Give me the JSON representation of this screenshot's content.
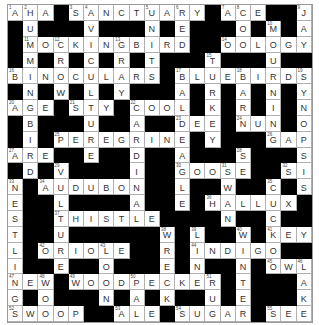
{
  "puzzle": {
    "rows": 20,
    "cols": 20,
    "grid": [
      "AHA#SANCTUARY#ACE##J",
      "#U###V###N#E###O#M#A",
      "#MOCKINGBIRD##OOLOGY",
      "#M#R#C#R#T###T###U##",
      "BINOCULARS#BLUEBIRDS",
      "#N#W#L#Y###A#R#A#N#Y",
      "AGE#STY#COOL#K#R#I#N",
      "#B###U##A##DEE#NUN#O",
      "#I#PEREGRINE#Y###GAP",
      "ARE##E##D##A###S###S",
      "#D#V####I##GOOSE##SI",
      "N#AUDUBON##L##W##C#S",
      "E##L####A##E#HALLUX#",
      "S##THISTLE####N##C##",
      "T##U######W#L##W#KEY",
      "L#ORIOLE##R#INDIGO##",
      "I##E##O###E#N##N#OWL",
      "NEW#WOODPECKER#T###A",
      "G#O###N#A#K##U#E###K",
      "SWOOP##ALE#SUGAR#SEE"
    ],
    "numbers": [
      [
        1,
        1,
        1
      ],
      [
        1,
        2,
        2
      ],
      [
        1,
        5,
        3
      ],
      [
        1,
        6,
        4
      ],
      [
        1,
        10,
        5
      ],
      [
        1,
        12,
        6
      ],
      [
        1,
        15,
        7
      ],
      [
        1,
        16,
        8
      ],
      [
        1,
        20,
        9
      ],
      [
        2,
        18,
        10
      ],
      [
        3,
        2,
        11
      ],
      [
        3,
        4,
        12
      ],
      [
        3,
        8,
        13
      ],
      [
        3,
        15,
        14
      ],
      [
        4,
        14,
        15
      ],
      [
        5,
        1,
        16
      ],
      [
        5,
        12,
        17
      ],
      [
        5,
        16,
        18
      ],
      [
        5,
        20,
        19
      ],
      [
        7,
        1,
        20
      ],
      [
        7,
        5,
        21
      ],
      [
        7,
        9,
        22
      ],
      [
        8,
        12,
        23
      ],
      [
        8,
        16,
        24
      ],
      [
        9,
        4,
        25
      ],
      [
        9,
        18,
        26
      ],
      [
        10,
        1,
        27
      ],
      [
        10,
        16,
        28
      ],
      [
        11,
        4,
        29
      ],
      [
        11,
        12,
        30
      ],
      [
        11,
        15,
        31
      ],
      [
        11,
        19,
        32
      ],
      [
        12,
        1,
        33
      ],
      [
        12,
        3,
        34
      ],
      [
        12,
        18,
        35
      ],
      [
        13,
        14,
        36
      ],
      [
        14,
        4,
        37
      ],
      [
        15,
        11,
        38
      ],
      [
        15,
        13,
        39
      ],
      [
        15,
        16,
        40
      ],
      [
        15,
        18,
        41
      ],
      [
        16,
        3,
        42
      ],
      [
        16,
        7,
        43
      ],
      [
        16,
        13,
        44
      ],
      [
        17,
        18,
        45
      ],
      [
        17,
        20,
        46
      ],
      [
        18,
        1,
        47
      ],
      [
        18,
        3,
        48
      ],
      [
        18,
        5,
        49
      ],
      [
        18,
        9,
        50
      ],
      [
        18,
        14,
        51
      ],
      [
        20,
        1,
        52
      ],
      [
        20,
        8,
        53
      ],
      [
        20,
        12,
        54
      ],
      [
        20,
        18,
        55
      ]
    ],
    "colors": {
      "white_cell": "#ffffff",
      "black_cell": "#000000",
      "letter": "#333333",
      "grid_line": "#b0b0b0"
    }
  }
}
